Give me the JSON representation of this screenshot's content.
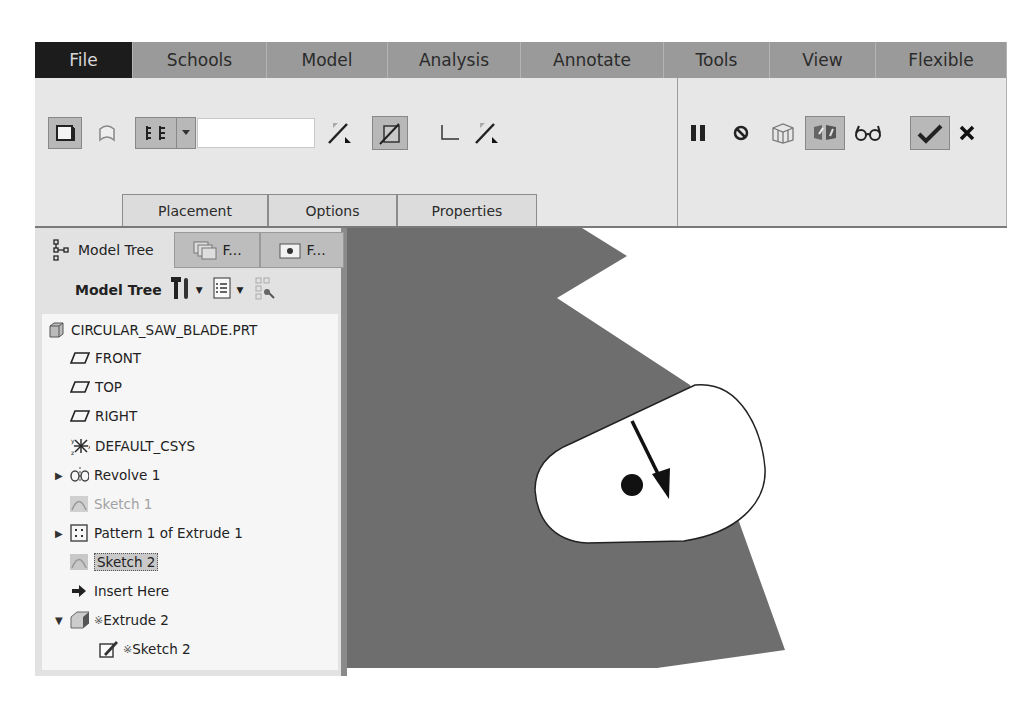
{
  "menu": {
    "items": [
      {
        "label": "File",
        "width": 98
      },
      {
        "label": "Schools",
        "width": 134
      },
      {
        "label": "Model",
        "width": 121
      },
      {
        "label": "Analysis",
        "width": 133
      },
      {
        "label": "Annotate",
        "width": 143
      },
      {
        "label": "Tools",
        "width": 106
      },
      {
        "label": "View",
        "width": 106
      },
      {
        "label": "Flexible",
        "width": 131
      }
    ]
  },
  "ribbon": {
    "left_tools": [
      {
        "name": "extrude-as-solid-icon",
        "pressed": true
      },
      {
        "name": "extrude-as-surface-icon",
        "pressed": false
      },
      {
        "name": "depth-option-icon",
        "pressed": true
      },
      {
        "name": "depth-dropdown-icon",
        "pressed": true
      },
      {
        "name": "flip-depth-direction-icon",
        "pressed": false
      },
      {
        "name": "remove-material-icon",
        "pressed": true
      },
      {
        "name": "thicken-sketch-icon",
        "pressed": false
      },
      {
        "name": "flip-material-side-icon",
        "pressed": false
      }
    ],
    "depth_value": "",
    "right_tools": [
      {
        "name": "pause-icon",
        "pressed": false
      },
      {
        "name": "no-preview-icon",
        "pressed": false
      },
      {
        "name": "preview-mesh-icon",
        "pressed": false
      },
      {
        "name": "preview-solid-icon",
        "pressed": true
      },
      {
        "name": "verify-glasses-icon",
        "pressed": false
      },
      {
        "name": "confirm-check-icon",
        "pressed": true
      },
      {
        "name": "cancel-x-icon",
        "pressed": false
      }
    ],
    "tabs": [
      "Placement",
      "Options",
      "Properties"
    ]
  },
  "panel": {
    "tabs": [
      {
        "label": "Model Tree",
        "active": true
      },
      {
        "label": "F...",
        "active": false
      },
      {
        "label": "F...",
        "active": false
      }
    ],
    "toolbar_title": "Model Tree"
  },
  "tree": {
    "items": [
      {
        "label": "CIRCULAR_SAW_BLADE.PRT",
        "icon": "part-icon",
        "indent": 0,
        "caret": "",
        "state": "normal"
      },
      {
        "label": "FRONT",
        "icon": "datum-plane-icon",
        "indent": 1,
        "caret": "",
        "state": "normal"
      },
      {
        "label": "TOP",
        "icon": "datum-plane-icon",
        "indent": 1,
        "caret": "",
        "state": "normal"
      },
      {
        "label": "RIGHT",
        "icon": "datum-plane-icon",
        "indent": 1,
        "caret": "",
        "state": "normal"
      },
      {
        "label": "DEFAULT_CSYS",
        "icon": "coordinate-system-icon",
        "indent": 1,
        "caret": "",
        "state": "normal"
      },
      {
        "label": "Revolve 1",
        "icon": "revolve-icon",
        "indent": 1,
        "caret": "▶",
        "state": "normal"
      },
      {
        "label": "Sketch 1",
        "icon": "sketch-icon",
        "indent": 1,
        "caret": "",
        "state": "hidden"
      },
      {
        "label": "Pattern 1 of Extrude 1",
        "icon": "pattern-icon",
        "indent": 1,
        "caret": "▶",
        "state": "normal"
      },
      {
        "label": "Sketch 2",
        "icon": "sketch-icon",
        "indent": 1,
        "caret": "",
        "state": "selected"
      },
      {
        "label": "Insert Here",
        "icon": "insert-arrow-icon",
        "indent": 1,
        "caret": "",
        "state": "normal"
      },
      {
        "label": "Extrude 2",
        "icon": "extrude-icon",
        "indent": 1,
        "caret": "▼",
        "state": "in-progress"
      },
      {
        "label": "Sketch 2",
        "icon": "sketch-edit-icon",
        "indent": 2,
        "caret": "",
        "state": "in-progress"
      }
    ],
    "in_progress_marker": "※"
  },
  "colors": {
    "menubar": "#9a9a9a",
    "file_tab": "#1c1c1c",
    "ribbon": "#e7e7e7",
    "solid_fill": "#6e6e6e",
    "panel": "#e2e2e2"
  }
}
